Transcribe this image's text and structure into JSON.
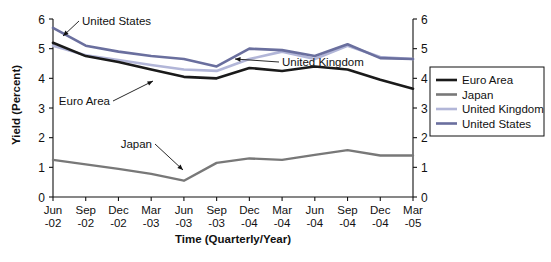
{
  "chart_data": {
    "type": "line",
    "title": "",
    "xlabel": "Time (Quarterly/Year)",
    "ylabel": "Yield (Percent)",
    "ylim": [
      0,
      6
    ],
    "yticks": [
      0,
      1,
      2,
      3,
      4,
      5,
      6
    ],
    "ytick_labels": [
      "0",
      "1",
      "2",
      "3",
      "4",
      "5",
      "6"
    ],
    "right_axis": true,
    "right_ytick_labels": [
      "0",
      "1",
      "2",
      "3",
      "4",
      "5",
      "6"
    ],
    "grid": false,
    "legend_position": "right",
    "categories": [
      "Jun-02",
      "Sep-02",
      "Dec-02",
      "Mar-03",
      "Jun-03",
      "Sep-03",
      "Dec-03",
      "Mar-04",
      "Jun-04",
      "Sep-04",
      "Dec-04",
      "Mar-05"
    ],
    "xtick_labels_line1": [
      "Jun",
      "Sep",
      "Dec",
      "Mar",
      "Jun",
      "Sep",
      "Dec",
      "Mar",
      "Jun",
      "Sep",
      "Dec",
      "Mar"
    ],
    "xtick_labels_line2": [
      "-02",
      "-02",
      "-02",
      "-03",
      "-03",
      "-03",
      "-04",
      "-04",
      "-04",
      "-04",
      "-04",
      "-05"
    ],
    "series": [
      {
        "name": "Euro Area",
        "color": "#1a1a1a",
        "width": 2.6,
        "values": [
          5.2,
          4.75,
          4.55,
          4.3,
          4.05,
          4.0,
          4.35,
          4.25,
          4.4,
          4.3,
          3.95,
          3.65
        ]
      },
      {
        "name": "Japan",
        "color": "#787878",
        "width": 2.4,
        "values": [
          1.25,
          1.1,
          0.95,
          0.78,
          0.55,
          1.15,
          1.3,
          1.25,
          1.42,
          1.58,
          1.4,
          1.4
        ]
      },
      {
        "name": "United Kingdom",
        "color": "#b2b6d8",
        "width": 2.6,
        "values": [
          5.1,
          4.78,
          4.62,
          4.45,
          4.3,
          4.25,
          4.65,
          4.9,
          4.65,
          5.1,
          4.72,
          4.65
        ]
      },
      {
        "name": "United States",
        "color": "#6a6f9e",
        "width": 2.6,
        "values": [
          5.7,
          5.1,
          4.9,
          4.75,
          4.65,
          4.4,
          5.0,
          4.95,
          4.75,
          5.15,
          4.68,
          4.65
        ]
      }
    ],
    "annotations": [
      {
        "text": "United States",
        "label_x": 82,
        "label_y": 25,
        "tip_x": 63,
        "tip_y": 36
      },
      {
        "text": "Euro Area",
        "label_x": 110,
        "label_y": 105,
        "tip_x": 153,
        "tip_y": 81
      },
      {
        "text": "United Kingdom",
        "label_x": 282,
        "label_y": 66,
        "tip_x": 235,
        "tip_y": 59
      },
      {
        "text": "Japan",
        "label_x": 152,
        "label_y": 148,
        "tip_x": 183,
        "tip_y": 170
      }
    ],
    "legend_entries": [
      {
        "label": "Euro Area",
        "color": "#1a1a1a"
      },
      {
        "label": "Japan",
        "color": "#787878"
      },
      {
        "label": "United Kingdom",
        "color": "#b2b6d8"
      },
      {
        "label": "United States",
        "color": "#6a6f9e"
      }
    ]
  }
}
